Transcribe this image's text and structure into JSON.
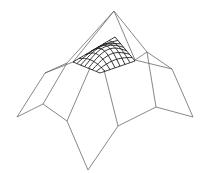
{
  "diagram": {
    "type": "wireframe-surface",
    "colors": {
      "background": "#ffffff",
      "control_net": "#6a6a6a",
      "patch_grid": "#1a1a1a"
    },
    "control_points": {
      "apex": [
        114,
        11
      ],
      "left_top": [
        67,
        63
      ],
      "patch_left": [
        73,
        62
      ],
      "patch_right": [
        135,
        60
      ],
      "right_top": [
        147,
        52
      ],
      "left_mid": [
        45,
        73
      ],
      "right_mid": [
        172,
        69
      ],
      "leftmost": [
        17,
        117
      ],
      "rightmost": [
        193,
        117
      ],
      "left_low": [
        43,
        104
      ],
      "right_low": [
        156,
        107
      ],
      "inner_left": [
        67,
        121
      ],
      "inner_right": [
        118,
        126
      ],
      "bottom": [
        88,
        170
      ],
      "patch_bottom_left": [
        90,
        68
      ],
      "patch_bottom_right": [
        104,
        70
      ]
    },
    "edges": [
      [
        "apex",
        "left_top"
      ],
      [
        "apex",
        "patch_left"
      ],
      [
        "apex",
        "patch_right"
      ],
      [
        "apex",
        "right_top"
      ],
      [
        "left_top",
        "left_mid"
      ],
      [
        "patch_left",
        "left_mid"
      ],
      [
        "left_mid",
        "leftmost"
      ],
      [
        "left_top",
        "left_low"
      ],
      [
        "leftmost",
        "left_low"
      ],
      [
        "left_low",
        "inner_left"
      ],
      [
        "patch_bottom_left",
        "inner_left"
      ],
      [
        "inner_left",
        "bottom"
      ],
      [
        "bottom",
        "inner_right"
      ],
      [
        "patch_bottom_right",
        "inner_right"
      ],
      [
        "inner_right",
        "right_low"
      ],
      [
        "right_low",
        "rightmost"
      ],
      [
        "rightmost",
        "right_mid"
      ],
      [
        "right_top",
        "right_mid"
      ],
      [
        "patch_right",
        "right_mid"
      ],
      [
        "patch_right",
        "right_top"
      ],
      [
        "right_top",
        "right_low"
      ]
    ],
    "patch": {
      "corners": {
        "left": [
          73,
          62
        ],
        "top": [
          115,
          37
        ],
        "right": [
          135,
          61
        ],
        "bottom": [
          100,
          73
        ]
      },
      "grid_divisions_u": 7,
      "grid_divisions_v": 7
    }
  }
}
